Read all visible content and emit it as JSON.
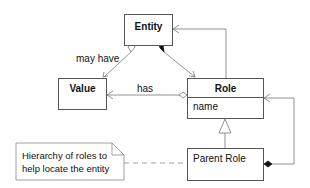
{
  "diagram": {
    "type": "uml-class-diagram",
    "classes": [
      {
        "id": "entity",
        "name": "Entity",
        "attributes": []
      },
      {
        "id": "value",
        "name": "Value",
        "attributes": []
      },
      {
        "id": "role",
        "name": "Role",
        "attributes": [
          "name"
        ]
      },
      {
        "id": "parent_role",
        "name": "Parent Role",
        "attributes": []
      }
    ],
    "relationships": [
      {
        "from": "entity",
        "to": "value",
        "kind": "aggregation",
        "label": "may have"
      },
      {
        "from": "entity",
        "to": "role",
        "kind": "composition",
        "label": ""
      },
      {
        "from": "role",
        "to": "value",
        "kind": "aggregation",
        "label": "has"
      },
      {
        "from": "role",
        "to": "entity",
        "kind": "association",
        "label": ""
      },
      {
        "from": "parent_role",
        "to": "role",
        "kind": "generalization",
        "label": ""
      },
      {
        "from": "parent_role",
        "to": "role",
        "kind": "composition",
        "label": ""
      }
    ],
    "note": {
      "line1": "Hierarchy of roles to",
      "line2": "help locate the entity",
      "attached_to": "parent_role"
    }
  },
  "labels": {
    "entity": "Entity",
    "value": "Value",
    "role": "Role",
    "role_attr": "name",
    "parent_role": "Parent Role",
    "may_have": "may have",
    "has": "has"
  },
  "colors": {
    "line": "#666666",
    "border": "#555555",
    "fill_dark": "#111111"
  }
}
